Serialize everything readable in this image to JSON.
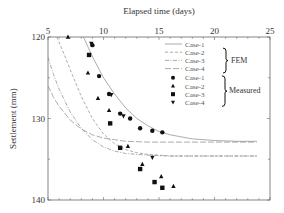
{
  "chart_data": {
    "type": "scatter",
    "title": "",
    "xlabel": "Elapsed time (days)",
    "ylabel": "Settlement (mm)",
    "xlim": [
      5,
      25
    ],
    "ylim": [
      120,
      140
    ],
    "y_inverted": true,
    "x_axis_position": "top",
    "x_ticks": [
      5,
      10,
      15,
      20,
      25
    ],
    "y_ticks": [
      120,
      130,
      140
    ],
    "grid": false,
    "legend_position": "top-right",
    "legend_groups": [
      {
        "label": "FEM",
        "entries": [
          "Case-1",
          "Case-2",
          "Case-3",
          "Case-4"
        ]
      },
      {
        "label": "Measured",
        "entries": [
          "Case-1",
          "Case-2",
          "Case-3",
          "Case-4"
        ]
      }
    ],
    "fem_series": [
      {
        "name": "Case-1",
        "style": "solid",
        "x": [
          8.2,
          9,
          10,
          11,
          12,
          13,
          14,
          15,
          16,
          18,
          20,
          22,
          23.8
        ],
        "y": [
          120.0,
          122.4,
          125.0,
          127.0,
          128.7,
          130.0,
          130.9,
          131.6,
          132.0,
          132.5,
          132.7,
          132.8,
          132.8
        ]
      },
      {
        "name": "Case-2",
        "style": "dashed",
        "x": [
          5.8,
          6.5,
          7,
          8,
          9,
          10,
          11,
          12,
          13,
          14,
          16,
          18,
          20,
          23.8
        ],
        "y": [
          120.0,
          122.3,
          124.0,
          127.3,
          130.0,
          131.9,
          133.1,
          133.8,
          134.2,
          134.4,
          134.6,
          134.6,
          134.6,
          134.6
        ]
      },
      {
        "name": "Case-3",
        "style": "dash-dot",
        "x": [
          5.0,
          5.5,
          6,
          7,
          8,
          9,
          10,
          11,
          12,
          14,
          16,
          20,
          23.8
        ],
        "y": [
          122.5,
          124.6,
          126.4,
          129.2,
          131.2,
          132.6,
          133.5,
          134.0,
          134.3,
          134.5,
          134.6,
          134.6,
          134.6
        ]
      },
      {
        "name": "Case-4",
        "style": "long-dash",
        "x": [
          5.0,
          5.5,
          6,
          7,
          8,
          9,
          10,
          11,
          12,
          14,
          16,
          20,
          23.8
        ],
        "y": [
          126.0,
          127.4,
          128.5,
          130.2,
          131.3,
          132.0,
          132.4,
          132.6,
          132.8,
          132.9,
          132.9,
          132.9,
          132.9
        ]
      }
    ],
    "measured_series": [
      {
        "name": "Case-1",
        "marker": "circle",
        "x": [
          9.0,
          9.6,
          10.5,
          11.5,
          12.4,
          13.3,
          14.4,
          15.3
        ],
        "y": [
          121.0,
          124.8,
          127.0,
          129.4,
          130.0,
          131.2,
          131.5,
          131.7
        ]
      },
      {
        "name": "Case-2",
        "marker": "triangle-up",
        "x": [
          6.8,
          8.6,
          9.5,
          10.5,
          12.2,
          13.5,
          15.2,
          16.3
        ],
        "y": [
          120.0,
          124.4,
          127.5,
          129.0,
          133.4,
          135.6,
          137.1,
          138.3
        ]
      },
      {
        "name": "Case-3",
        "marker": "square",
        "x": [
          8.7,
          10.6,
          11.5,
          13.3,
          14.6,
          15.3
        ],
        "y": [
          122.2,
          130.6,
          133.6,
          136.2,
          137.8,
          138.5
        ]
      },
      {
        "name": "Case-4",
        "marker": "triangle-down",
        "x": [
          8.9,
          10.7,
          11.8,
          14.4
        ],
        "y": [
          120.8,
          127.1,
          129.7,
          134.8
        ]
      }
    ]
  },
  "labels": {
    "xlabel": "Elapsed time (days)",
    "ylabel": "Settlement (mm)",
    "x_ticks": [
      "5",
      "10",
      "15",
      "20",
      "25"
    ],
    "y_ticks": [
      "120",
      "130",
      "140"
    ],
    "fem_group": "FEM",
    "measured_group": "Measured",
    "fem_entries": [
      "Case-1",
      "Case-2",
      "Case-3",
      "Case-4"
    ],
    "measured_entries": [
      "Case-1",
      "Case-2",
      "Case-3",
      "Case-4"
    ]
  }
}
